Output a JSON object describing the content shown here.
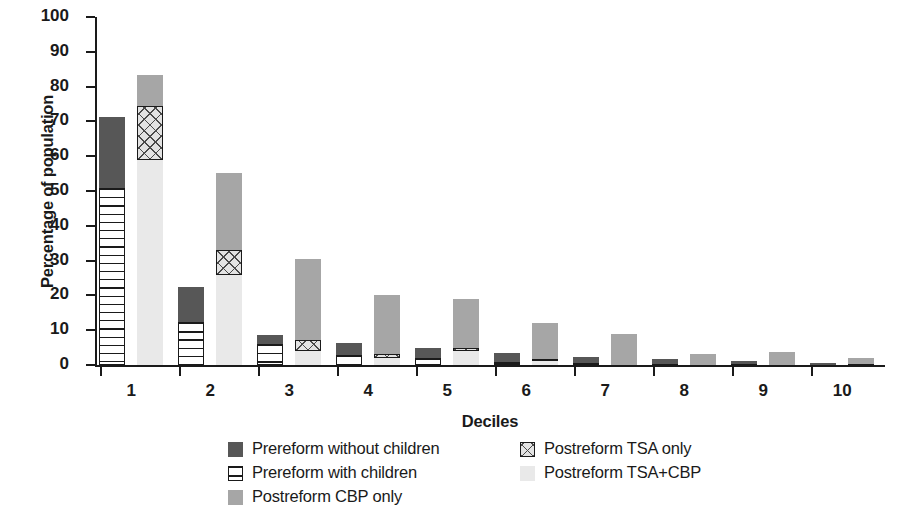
{
  "chart_data": {
    "type": "bar",
    "title": "",
    "xlabel": "Deciles",
    "ylabel": "Percentage of population",
    "ylim": [
      0,
      100
    ],
    "yticks": [
      0,
      10,
      20,
      30,
      40,
      50,
      60,
      70,
      80,
      90,
      100
    ],
    "grid": false,
    "legend_position": "bottom",
    "stacked": true,
    "grouped": true,
    "categories": [
      "1",
      "2",
      "3",
      "4",
      "5",
      "6",
      "7",
      "8",
      "9",
      "10"
    ],
    "groups": [
      {
        "name": "Prereform",
        "series": [
          {
            "name": "Prereform with children",
            "key": "pre_with",
            "color": "#ffffff",
            "pattern": "horizontal-lines",
            "values": [
              50.8,
              12.3,
              6.0,
              3.0,
              2.0,
              1.0,
              0.7,
              0.3,
              0.2,
              0.1
            ]
          },
          {
            "name": "Prereform without children",
            "key": "pre_without",
            "color": "#575757",
            "pattern": "solid",
            "values": [
              20.5,
              10.2,
              2.6,
              3.4,
              2.9,
              2.5,
              1.5,
              1.4,
              1.0,
              0.5
            ]
          }
        ],
        "totals": [
          71.3,
          22.5,
          8.6,
          6.4,
          4.9,
          3.5,
          2.2,
          1.7,
          1.2,
          0.6
        ]
      },
      {
        "name": "Postreform",
        "series": [
          {
            "name": "Postreform TSA+CBP",
            "key": "post_tsa_cbp",
            "color": "#e9e9e9",
            "pattern": "light-solid",
            "values": [
              59.0,
              26.0,
              4.0,
              2.0,
              4.0,
              1.2,
              0.0,
              0.0,
              0.0,
              0.0
            ]
          },
          {
            "name": "Postreform TSA only",
            "key": "post_tsa",
            "color": "#e3e3e3",
            "pattern": "cross-hatch",
            "values": [
              15.5,
              7.0,
              3.2,
              1.3,
              0.8,
              0.5,
              0.0,
              0.0,
              0.0,
              0.4
            ]
          },
          {
            "name": "Postreform CBP only",
            "key": "post_cbp",
            "color": "#a6a6a6",
            "pattern": "solid",
            "values": [
              8.7,
              22.3,
              23.2,
              16.7,
              14.2,
              10.3,
              9.0,
              3.3,
              3.8,
              1.5
            ]
          }
        ],
        "totals": [
          83.2,
          55.3,
          30.4,
          20.0,
          19.0,
          12.0,
          9.0,
          3.3,
          3.8,
          1.9
        ]
      }
    ]
  },
  "axes": {
    "y_title": "Percentage of population",
    "x_title": "Deciles",
    "y_tick_labels": [
      "0",
      "10",
      "20",
      "30",
      "40",
      "50",
      "60",
      "70",
      "80",
      "90",
      "100"
    ],
    "x_tick_labels": [
      "1",
      "2",
      "3",
      "4",
      "5",
      "6",
      "7",
      "8",
      "9",
      "10"
    ]
  },
  "legend": {
    "items": [
      {
        "label": "Prereform without children",
        "swatch": "pre-without-children-swatch"
      },
      {
        "label": "Postreform TSA only",
        "swatch": "postreform-tsa-only-swatch"
      },
      {
        "label": "Prereform with children",
        "swatch": "pre-with-children-swatch"
      },
      {
        "label": "Postreform TSA+CBP",
        "swatch": "postreform-tsa-cbp-swatch"
      },
      {
        "label": "Postreform CBP only",
        "swatch": "postreform-cbp-only-swatch"
      }
    ]
  },
  "colors": {
    "prereform_without_children": "#575757",
    "prereform_with_children": "#ffffff",
    "postreform_cbp_only": "#a6a6a6",
    "postreform_tsa_only": "#e3e3e3",
    "postreform_tsa_cbp": "#e9e9e9",
    "axis": "#1a1a1a"
  }
}
